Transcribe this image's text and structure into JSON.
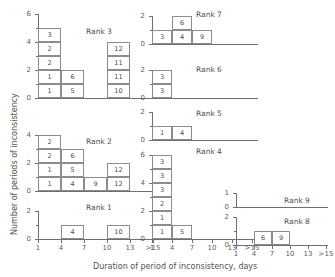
{
  "figure": {
    "ylabel": "Number of periods of inconsistency",
    "xlabel": "Duration of period of inconsistency, days",
    "tick_labels_x": [
      "1",
      "4",
      "7",
      "10",
      "13",
      ">15"
    ],
    "axis_color": "#6f6f6f",
    "cell_border_color": "#8c8c8c",
    "text_color": "#4f4f4f"
  },
  "chart_data": {
    "type": "bar",
    "title": "",
    "xlabel": "Duration of period of inconsistency, days",
    "ylabel": "Number of periods of inconsistency",
    "categories": [
      "1",
      "4",
      "7",
      "10",
      "13",
      ">15"
    ],
    "note": "Stacked unit-squares; each square is labelled with the duration value of the individual observation it represents.",
    "panels": [
      {
        "name": "Rank 3",
        "label": "Rank 3",
        "ylim": [
          0,
          6
        ],
        "yticks": [
          0,
          2,
          4,
          6
        ],
        "columns": [
          {
            "category": "1",
            "values": [
              "1",
              "1",
              "2",
              "2",
              "3"
            ],
            "height": 5
          },
          {
            "category": "4",
            "values": [
              "5",
              "6"
            ],
            "height": 2
          },
          {
            "category": "7",
            "values": [],
            "height": 0
          },
          {
            "category": "10",
            "values": [
              "10",
              "11",
              "11",
              "12"
            ],
            "height": 4
          },
          {
            "category": "13",
            "values": [],
            "height": 0
          },
          {
            "category": ">15",
            "values": [],
            "height": 0
          }
        ]
      },
      {
        "name": "Rank 2",
        "label": "Rank 2",
        "ylim": [
          0,
          4
        ],
        "yticks": [
          0,
          2,
          4
        ],
        "columns": [
          {
            "category": "1",
            "values": [
              "1",
              "1",
              "2",
              "2"
            ],
            "height": 4
          },
          {
            "category": "4",
            "values": [
              "4",
              "5",
              "6"
            ],
            "height": 3
          },
          {
            "category": "7",
            "values": [
              "9"
            ],
            "height": 1
          },
          {
            "category": "10",
            "values": [
              "12",
              "12"
            ],
            "height": 2
          },
          {
            "category": "13",
            "values": [],
            "height": 0
          },
          {
            "category": ">15",
            "values": [],
            "height": 0
          }
        ]
      },
      {
        "name": "Rank 1",
        "label": "Rank 1",
        "ylim": [
          0,
          2
        ],
        "yticks": [
          0,
          2
        ],
        "columns": [
          {
            "category": "1",
            "values": [],
            "height": 0
          },
          {
            "category": "4",
            "values": [
              "4"
            ],
            "height": 1
          },
          {
            "category": "7",
            "values": [],
            "height": 0
          },
          {
            "category": "10",
            "values": [
              "10"
            ],
            "height": 1
          },
          {
            "category": "13",
            "values": [],
            "height": 0
          },
          {
            "category": ">15",
            "values": [],
            "height": 0
          }
        ]
      },
      {
        "name": "Rank 7",
        "label": "Rank 7",
        "ylim": [
          0,
          2
        ],
        "yticks": [
          0,
          2
        ],
        "columns": [
          {
            "category": "1",
            "values": [
              "3"
            ],
            "height": 1
          },
          {
            "category": "4",
            "values": [
              "4",
              "6"
            ],
            "height": 2
          },
          {
            "category": "7",
            "values": [
              "9"
            ],
            "height": 1
          },
          {
            "category": "10",
            "values": [],
            "height": 0
          },
          {
            "category": "13",
            "values": [],
            "height": 0
          },
          {
            "category": ">15",
            "values": [],
            "height": 0
          }
        ]
      },
      {
        "name": "Rank 6",
        "label": "Rank 6",
        "ylim": [
          0,
          2
        ],
        "yticks": [
          0,
          2
        ],
        "columns": [
          {
            "category": "1",
            "values": [
              "3",
              "3"
            ],
            "height": 2
          },
          {
            "category": "4",
            "values": [],
            "height": 0
          },
          {
            "category": "7",
            "values": [],
            "height": 0
          },
          {
            "category": "10",
            "values": [],
            "height": 0
          },
          {
            "category": "13",
            "values": [],
            "height": 0
          },
          {
            "category": ">15",
            "values": [],
            "height": 0
          }
        ]
      },
      {
        "name": "Rank 5",
        "label": "Rank 5",
        "ylim": [
          0,
          2
        ],
        "yticks": [
          0,
          2
        ],
        "columns": [
          {
            "category": "1",
            "values": [
              "1"
            ],
            "height": 1
          },
          {
            "category": "4",
            "values": [
              "4"
            ],
            "height": 1
          },
          {
            "category": "7",
            "values": [],
            "height": 0
          },
          {
            "category": "10",
            "values": [],
            "height": 0
          },
          {
            "category": "13",
            "values": [],
            "height": 0
          },
          {
            "category": ">15",
            "values": [],
            "height": 0
          }
        ]
      },
      {
        "name": "Rank 4",
        "label": "Rank 4",
        "ylim": [
          0,
          6
        ],
        "yticks": [
          0,
          2,
          4,
          6
        ],
        "columns": [
          {
            "category": "1",
            "values": [
              "1",
              "1",
              "2",
              "3",
              "3",
              "3"
            ],
            "height": 6
          },
          {
            "category": "4",
            "values": [
              "5"
            ],
            "height": 1
          },
          {
            "category": "7",
            "values": [],
            "height": 0
          },
          {
            "category": "10",
            "values": [],
            "height": 0
          },
          {
            "category": "13",
            "values": [],
            "height": 0
          },
          {
            "category": ">15",
            "values": [],
            "height": 0
          }
        ]
      },
      {
        "name": "Rank 9",
        "label": "Rank 9",
        "ylim": [
          0,
          1
        ],
        "yticks": [
          0,
          1
        ],
        "columns": [
          {
            "category": "1",
            "values": [],
            "height": 0
          },
          {
            "category": "4",
            "values": [],
            "height": 0
          },
          {
            "category": "7",
            "values": [],
            "height": 0
          },
          {
            "category": "10",
            "values": [],
            "height": 0
          },
          {
            "category": "13",
            "values": [],
            "height": 0
          },
          {
            "category": ">15",
            "values": [],
            "height": 0
          }
        ]
      },
      {
        "name": "Rank 8",
        "label": "Rank 8",
        "ylim": [
          0,
          2
        ],
        "yticks": [
          0,
          2
        ],
        "columns": [
          {
            "category": "1",
            "values": [],
            "height": 0
          },
          {
            "category": "4",
            "values": [
              "6"
            ],
            "height": 1
          },
          {
            "category": "7",
            "values": [
              "9"
            ],
            "height": 1
          },
          {
            "category": "10",
            "values": [],
            "height": 0
          },
          {
            "category": "13",
            "values": [],
            "height": 0
          },
          {
            "category": ">15",
            "values": [],
            "height": 0
          }
        ]
      }
    ]
  },
  "layout": {
    "panels": [
      {
        "name": "Rank 3",
        "left": 38,
        "baseline": 98,
        "cell_w": 23,
        "cell_h": 14,
        "rank_x": 86,
        "rank_y": 28,
        "xaxis_w": 118,
        "show_xticks": false,
        "ytick_px": 14
      },
      {
        "name": "Rank 2",
        "left": 38,
        "baseline": 191,
        "cell_w": 23,
        "cell_h": 14,
        "rank_x": 86,
        "rank_y": 138,
        "xaxis_w": 118,
        "show_xticks": false,
        "ytick_px": 14
      },
      {
        "name": "Rank 1",
        "left": 38,
        "baseline": 239,
        "cell_w": 23,
        "cell_h": 14,
        "rank_x": 86,
        "rank_y": 204,
        "xaxis_w": 118,
        "show_xticks": true,
        "ytick_px": 14
      },
      {
        "name": "Rank 7",
        "left": 152,
        "baseline": 44,
        "cell_w": 20,
        "cell_h": 14,
        "rank_x": 196,
        "rank_y": 11,
        "xaxis_w": 106,
        "show_xticks": false,
        "ytick_px": 14
      },
      {
        "name": "Rank 6",
        "left": 152,
        "baseline": 98,
        "cell_w": 20,
        "cell_h": 14,
        "rank_x": 196,
        "rank_y": 66,
        "xaxis_w": 106,
        "show_xticks": false,
        "ytick_px": 14
      },
      {
        "name": "Rank 5",
        "left": 152,
        "baseline": 140,
        "cell_w": 20,
        "cell_h": 14,
        "rank_x": 196,
        "rank_y": 110,
        "xaxis_w": 106,
        "show_xticks": false,
        "ytick_px": 14
      },
      {
        "name": "Rank 4",
        "left": 152,
        "baseline": 239,
        "cell_w": 20,
        "cell_h": 14,
        "rank_x": 196,
        "rank_y": 148,
        "xaxis_w": 106,
        "show_xticks": true,
        "ytick_px": 14
      },
      {
        "name": "Rank 9",
        "left": 236,
        "baseline": 207,
        "cell_w": 18,
        "cell_h": 14,
        "rank_x": 284,
        "rank_y": 197,
        "xaxis_w": 92,
        "show_xticks": false,
        "ytick_px": 14
      },
      {
        "name": "Rank 8",
        "left": 236,
        "baseline": 245,
        "cell_w": 18,
        "cell_h": 14,
        "rank_x": 284,
        "rank_y": 218,
        "xaxis_w": 92,
        "show_xticks": true,
        "ytick_px": 14
      }
    ]
  }
}
